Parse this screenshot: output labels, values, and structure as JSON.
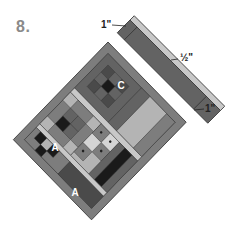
{
  "figure": {
    "step_number": "8.",
    "dimension_labels": [
      {
        "id": "top",
        "text": "1\"",
        "x": 101,
        "y": 26
      },
      {
        "id": "middle",
        "text": "½\"",
        "x": 180,
        "y": 58
      },
      {
        "id": "bottom",
        "text": "1\"",
        "x": 205,
        "y": 105
      }
    ],
    "block_labels": [
      {
        "id": "C",
        "text": "C"
      },
      {
        "id": "A1",
        "text": "A"
      },
      {
        "id": "B",
        "text": "B"
      },
      {
        "id": "A2",
        "text": "A"
      }
    ],
    "colors": {
      "background": "#ffffff",
      "black": "#1a1a1a",
      "dark": "#4a4a4a",
      "medium_dark": "#636363",
      "medium": "#7d7d7d",
      "light": "#b4b4b4",
      "very_light": "#d4d4d4",
      "label_gray": "#8a8a8a",
      "outline": "#333333"
    }
  }
}
